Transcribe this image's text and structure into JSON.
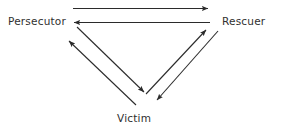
{
  "diagram": {
    "background_color": "#ffffff",
    "line_color": "#2b2b2b",
    "text_color": "#2f2f2f",
    "nodes": [
      {
        "id": "persecutor",
        "label": "Persecutor",
        "x": 45,
        "y": 22
      },
      {
        "id": "rescuer",
        "label": "Rescuer",
        "x": 243,
        "y": 22
      },
      {
        "id": "victim",
        "label": "Victim",
        "x": 140,
        "y": 118
      }
    ],
    "arrows": [
      {
        "id": "persecutor-to-rescuer",
        "from": "persecutor",
        "to": "rescuer",
        "direction": "right",
        "orientation": "horizontal"
      },
      {
        "id": "rescuer-to-persecutor",
        "from": "rescuer",
        "to": "persecutor",
        "direction": "left",
        "orientation": "horizontal"
      },
      {
        "id": "persecutor-to-victim",
        "from": "persecutor",
        "to": "victim",
        "direction": "down-right",
        "orientation": "diagonal-left"
      },
      {
        "id": "victim-to-persecutor",
        "from": "victim",
        "to": "persecutor",
        "direction": "up-left",
        "orientation": "diagonal-left"
      },
      {
        "id": "victim-to-rescuer",
        "from": "victim",
        "to": "rescuer",
        "direction": "up-right",
        "orientation": "diagonal-right"
      },
      {
        "id": "rescuer-to-victim",
        "from": "rescuer",
        "to": "victim",
        "direction": "down-left",
        "orientation": "diagonal-right"
      }
    ]
  }
}
